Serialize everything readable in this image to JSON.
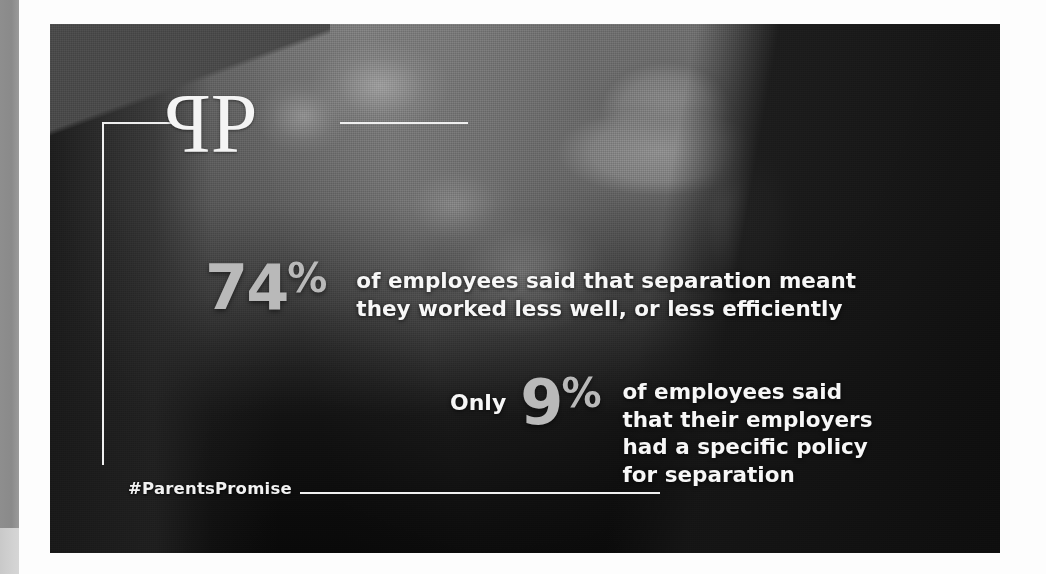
{
  "poster": {
    "brand": {
      "logo_mark": "PP",
      "logo_letter_mirrored": "P",
      "logo_letter_normal": "P",
      "logo_icon_name": "mirrored-double-p-monogram"
    },
    "statistics": [
      {
        "value": "74",
        "unit": "%",
        "prefix": "",
        "copy": "of employees said that separation meant\nthey worked less well, or less efficiently"
      },
      {
        "value": "9",
        "unit": "%",
        "prefix": "Only",
        "copy": "of employees said\nthat their employers\nhad a specific policy\nfor separation"
      }
    ],
    "hashtag": "#ParentsPromise",
    "colors": {
      "statistic_number": "#b9b9b9",
      "body_text": "#f7f7f7",
      "rule": "#efefef",
      "panel_background": "#3a3a3a",
      "page_background": "#fdfdfd"
    }
  }
}
